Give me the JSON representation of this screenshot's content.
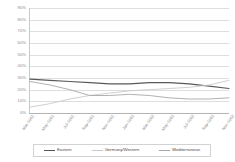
{
  "chart_data": {
    "type": "line",
    "title": "",
    "subtitle": "",
    "xlabel": "",
    "ylabel": "",
    "grid": true,
    "legend_position": "bottom",
    "ylim": [
      0,
      90
    ],
    "ytick_labels": [
      "90%",
      "80%",
      "70%",
      "60%",
      "50%",
      "40%",
      "30%",
      "20%",
      "10%",
      "0%"
    ],
    "ytick_values": [
      90,
      80,
      70,
      60,
      50,
      40,
      30,
      20,
      10,
      0
    ],
    "categories": [
      "Mar-1961",
      "May-1961",
      "Jul-1961",
      "Sep-1961",
      "Nov-1961",
      "Jan-1962",
      "Mar-1962",
      "May-1962",
      "Jul-1962",
      "Sep-1962",
      "Nov-1962"
    ],
    "series": [
      {
        "name": "Eastern",
        "color": "#58595b",
        "values": [
          29,
          28,
          27,
          26,
          25,
          25,
          26,
          26,
          25,
          23,
          21
        ]
      },
      {
        "name": "Germany/Western",
        "color": "#c9c9c9",
        "values": [
          5,
          8,
          12,
          15,
          17,
          19,
          20,
          21,
          22,
          24,
          28
        ]
      },
      {
        "name": "Mediterranean",
        "color": "#a8a8a8",
        "values": [
          27,
          24,
          20,
          15,
          15,
          16,
          15,
          13,
          12,
          12,
          13
        ]
      }
    ]
  },
  "legend": {
    "items": [
      {
        "label": "Eastern",
        "color": "#58595b"
      },
      {
        "label": "Germany/Western",
        "color": "#c9c9c9"
      },
      {
        "label": "Mediterranean",
        "color": "#a8a8a8"
      }
    ]
  }
}
